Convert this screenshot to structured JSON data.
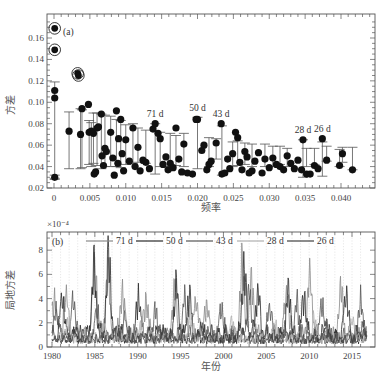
{
  "chart_data": [
    {
      "panel": "(a)",
      "type": "scatter",
      "title": "",
      "xlabel": "频率",
      "ylabel": "方差",
      "xlim": [
        0,
        0.0445
      ],
      "ylim": [
        0.02,
        0.175
      ],
      "xticks": [
        "0",
        "0.005",
        "0.010",
        "0.015",
        "0.020",
        "0.025",
        "0.030",
        "0.035",
        "0.040"
      ],
      "xtick_values": [
        0,
        0.005,
        0.01,
        0.015,
        0.02,
        0.025,
        0.03,
        0.035,
        0.04
      ],
      "yticks": [
        "0.02",
        "0.04",
        "0.06",
        "0.08",
        "0.10",
        "0.12",
        "0.14",
        "0.16"
      ],
      "ytick_values": [
        0.02,
        0.04,
        0.06,
        0.08,
        0.1,
        0.12,
        0.14,
        0.16
      ],
      "grid": false,
      "circled_points": [
        {
          "x": 0.0001,
          "y": 0.169
        },
        {
          "x": 0.0001,
          "y": 0.149
        },
        {
          "x": 0.0033,
          "y": 0.127
        },
        {
          "x": 0.0034,
          "y": 0.125
        }
      ],
      "points": [
        {
          "x": 0.0001,
          "y": 0.111,
          "err": [
            0.029,
            0.119
          ]
        },
        {
          "x": 0.0001,
          "y": 0.104
        },
        {
          "x": 0.0001,
          "y": 0.03,
          "err": [
            0.028,
            0.032
          ]
        },
        {
          "x": 0.0021,
          "y": 0.073,
          "err": [
            0.038,
            0.091
          ]
        },
        {
          "x": 0.0037,
          "y": 0.07,
          "err": [
            0.038,
            0.094
          ]
        },
        {
          "x": 0.0039,
          "y": 0.094,
          "err": [
            0.039,
            0.093
          ]
        },
        {
          "x": 0.0048,
          "y": 0.098
        },
        {
          "x": 0.0049,
          "y": 0.072,
          "err": [
            0.042,
            0.083
          ]
        },
        {
          "x": 0.0052,
          "y": 0.073,
          "err": [
            0.04,
            0.081
          ]
        },
        {
          "x": 0.0055,
          "y": 0.071,
          "err": [
            0.043,
            0.09
          ]
        },
        {
          "x": 0.0056,
          "y": 0.033
        },
        {
          "x": 0.0058,
          "y": 0.035
        },
        {
          "x": 0.006,
          "y": 0.076,
          "err": [
            0.041,
            0.09
          ]
        },
        {
          "x": 0.0062,
          "y": 0.077
        },
        {
          "x": 0.0066,
          "y": 0.089,
          "err": [
            0.038,
            0.089
          ]
        },
        {
          "x": 0.0067,
          "y": 0.05
        },
        {
          "x": 0.0069,
          "y": 0.041
        },
        {
          "x": 0.0071,
          "y": 0.057,
          "err": [
            0.04,
            0.088
          ]
        },
        {
          "x": 0.0073,
          "y": 0.054
        },
        {
          "x": 0.0079,
          "y": 0.072,
          "err": [
            0.04,
            0.087
          ]
        },
        {
          "x": 0.0082,
          "y": 0.048
        },
        {
          "x": 0.0084,
          "y": 0.032
        },
        {
          "x": 0.0087,
          "y": 0.092,
          "err": [
            0.04,
            0.084
          ]
        },
        {
          "x": 0.0089,
          "y": 0.043
        },
        {
          "x": 0.009,
          "y": 0.066
        },
        {
          "x": 0.0093,
          "y": 0.084,
          "err": [
            0.039,
            0.083
          ]
        },
        {
          "x": 0.0095,
          "y": 0.052
        },
        {
          "x": 0.0097,
          "y": 0.036
        },
        {
          "x": 0.01,
          "y": 0.065,
          "err": [
            0.042,
            0.079
          ]
        },
        {
          "x": 0.0105,
          "y": 0.045
        },
        {
          "x": 0.011,
          "y": 0.076,
          "err": [
            0.043,
            0.08
          ]
        },
        {
          "x": 0.0113,
          "y": 0.04
        },
        {
          "x": 0.0117,
          "y": 0.058,
          "err": [
            0.044,
            0.076
          ]
        },
        {
          "x": 0.012,
          "y": 0.036
        },
        {
          "x": 0.0124,
          "y": 0.046
        },
        {
          "x": 0.0128,
          "y": 0.044,
          "err": [
            0.043,
            0.074
          ]
        },
        {
          "x": 0.0133,
          "y": 0.038
        },
        {
          "x": 0.0138,
          "y": 0.075
        },
        {
          "x": 0.0141,
          "y": 0.08,
          "err": [
            0.033,
            0.08
          ]
        },
        {
          "x": 0.0145,
          "y": 0.071
        },
        {
          "x": 0.0148,
          "y": 0.066,
          "err": [
            0.04,
            0.072
          ]
        },
        {
          "x": 0.0152,
          "y": 0.042
        },
        {
          "x": 0.0156,
          "y": 0.049
        },
        {
          "x": 0.0159,
          "y": 0.037
        },
        {
          "x": 0.0162,
          "y": 0.043,
          "err": [
            0.04,
            0.071
          ]
        },
        {
          "x": 0.0166,
          "y": 0.039
        },
        {
          "x": 0.017,
          "y": 0.076,
          "err": [
            0.041,
            0.069
          ]
        },
        {
          "x": 0.0174,
          "y": 0.047
        },
        {
          "x": 0.0178,
          "y": 0.035
        },
        {
          "x": 0.0181,
          "y": 0.061,
          "err": [
            0.04,
            0.071
          ]
        },
        {
          "x": 0.0186,
          "y": 0.034
        },
        {
          "x": 0.0193,
          "y": 0.033
        },
        {
          "x": 0.0198,
          "y": 0.084
        },
        {
          "x": 0.02,
          "y": 0.084,
          "err": [
            0.038,
            0.086
          ]
        },
        {
          "x": 0.0206,
          "y": 0.055
        },
        {
          "x": 0.0209,
          "y": 0.06
        },
        {
          "x": 0.0213,
          "y": 0.037
        },
        {
          "x": 0.0216,
          "y": 0.042,
          "err": [
            0.04,
            0.067
          ]
        },
        {
          "x": 0.0219,
          "y": 0.045
        },
        {
          "x": 0.0226,
          "y": 0.062,
          "err": [
            0.047,
            0.066
          ]
        },
        {
          "x": 0.0233,
          "y": 0.08
        },
        {
          "x": 0.0234,
          "y": 0.033,
          "err": [
            0.032,
            0.078
          ]
        },
        {
          "x": 0.0238,
          "y": 0.034
        },
        {
          "x": 0.0242,
          "y": 0.047
        },
        {
          "x": 0.0245,
          "y": 0.038
        },
        {
          "x": 0.0249,
          "y": 0.052,
          "err": [
            0.04,
            0.063
          ]
        },
        {
          "x": 0.0253,
          "y": 0.072
        },
        {
          "x": 0.0256,
          "y": 0.067,
          "err": [
            0.041,
            0.064
          ]
        },
        {
          "x": 0.0259,
          "y": 0.044
        },
        {
          "x": 0.0262,
          "y": 0.037
        },
        {
          "x": 0.0266,
          "y": 0.054,
          "err": [
            0.042,
            0.062
          ]
        },
        {
          "x": 0.0269,
          "y": 0.049
        },
        {
          "x": 0.0272,
          "y": 0.034
        },
        {
          "x": 0.0276,
          "y": 0.036,
          "err": [
            0.04,
            0.061
          ]
        },
        {
          "x": 0.028,
          "y": 0.045
        },
        {
          "x": 0.0285,
          "y": 0.053
        },
        {
          "x": 0.029,
          "y": 0.034
        },
        {
          "x": 0.0294,
          "y": 0.047,
          "err": [
            0.04,
            0.061
          ]
        },
        {
          "x": 0.03,
          "y": 0.039
        },
        {
          "x": 0.0305,
          "y": 0.048,
          "err": [
            0.04,
            0.059
          ]
        },
        {
          "x": 0.031,
          "y": 0.042
        },
        {
          "x": 0.0315,
          "y": 0.04,
          "err": [
            0.042,
            0.059
          ]
        },
        {
          "x": 0.032,
          "y": 0.037
        },
        {
          "x": 0.0325,
          "y": 0.05,
          "err": [
            0.04,
            0.057
          ]
        },
        {
          "x": 0.033,
          "y": 0.043
        },
        {
          "x": 0.0335,
          "y": 0.038
        },
        {
          "x": 0.034,
          "y": 0.046
        },
        {
          "x": 0.0347,
          "y": 0.065,
          "err": [
            0.03,
            0.065
          ]
        },
        {
          "x": 0.0345,
          "y": 0.037
        },
        {
          "x": 0.0352,
          "y": 0.033,
          "err": [
            0.04,
            0.057
          ]
        },
        {
          "x": 0.0357,
          "y": 0.033
        },
        {
          "x": 0.0363,
          "y": 0.041,
          "err": [
            0.042,
            0.057
          ]
        },
        {
          "x": 0.0368,
          "y": 0.038
        },
        {
          "x": 0.0374,
          "y": 0.066,
          "err": [
            0.031,
            0.063
          ]
        },
        {
          "x": 0.038,
          "y": 0.046,
          "err": [
            0.045,
            0.059
          ]
        },
        {
          "x": 0.0398,
          "y": 0.041,
          "err": [
            0.04,
            0.056
          ]
        },
        {
          "x": 0.0402,
          "y": 0.052,
          "err": [
            0.044,
            0.058
          ]
        },
        {
          "x": 0.0416,
          "y": 0.037,
          "err": [
            0.037,
            0.058
          ]
        }
      ],
      "annotations": [
        {
          "text": "71 d",
          "x": 0.0141,
          "y": 0.083
        },
        {
          "text": "50 d",
          "x": 0.02,
          "y": 0.088
        },
        {
          "text": "43 d",
          "x": 0.0233,
          "y": 0.083
        },
        {
          "text": "28 d",
          "x": 0.0347,
          "y": 0.068
        },
        {
          "text": "26 d",
          "x": 0.0374,
          "y": 0.069
        }
      ]
    },
    {
      "panel": "(b)",
      "type": "line",
      "title": "",
      "xlabel": "年份",
      "ylabel": "局地方差",
      "y_scale_label": "×10⁻⁴",
      "xlim": [
        1979.9,
        2016.8
      ],
      "ylim": [
        0,
        9.5
      ],
      "xticks": [
        "1980",
        "1985",
        "1990",
        "1995",
        "2000",
        "2005",
        "2010",
        "2015"
      ],
      "xtick_values": [
        1980,
        1985,
        1990,
        1995,
        2000,
        2005,
        2010,
        2015
      ],
      "yticks": [
        "0",
        "2",
        "4",
        "6",
        "8"
      ],
      "ytick_values": [
        0,
        2,
        4,
        6,
        8
      ],
      "grid": "vertical dotted at each year",
      "legend": [
        "71 d",
        "50 d",
        "43 d",
        "28 d",
        "26 d"
      ],
      "legend_position": "top, inline horizontal",
      "series": [
        {
          "name": "71 d",
          "color": "#8a8a8a",
          "peaks": [
            [
              1980.3,
              4.2
            ],
            [
              1981.6,
              4.5
            ],
            [
              1985.0,
              7.4
            ],
            [
              1986.5,
              6.6
            ],
            [
              1988.2,
              5.0
            ],
            [
              1991.0,
              3.8
            ],
            [
              1994.3,
              5.3
            ],
            [
              1996.8,
              4.1
            ],
            [
              1998.0,
              3.4
            ],
            [
              2002.2,
              7.6
            ],
            [
              2003.3,
              5.8
            ],
            [
              2007.4,
              4.9
            ],
            [
              2010.1,
              6.6
            ],
            [
              2013.7,
              4.9
            ]
          ]
        },
        {
          "name": "50 d",
          "color": "#2a2a2a",
          "peaks": [
            [
              1981.2,
              4.3
            ],
            [
              1984.9,
              7.3
            ],
            [
              1986.6,
              8.9
            ],
            [
              1990.1,
              4.2
            ],
            [
              1994.5,
              5.1
            ],
            [
              1996.0,
              4.0
            ],
            [
              2002.4,
              7.2
            ],
            [
              2004.0,
              5.0
            ],
            [
              2007.6,
              4.6
            ],
            [
              2009.4,
              4.4
            ],
            [
              2014.3,
              4.6
            ]
          ]
        },
        {
          "name": "43 d",
          "color": "#555555",
          "peaks": [
            [
              1980.5,
              3.0
            ],
            [
              1982.5,
              3.8
            ],
            [
              1985.3,
              3.0
            ],
            [
              1988.5,
              2.0
            ],
            [
              1992.1,
              2.7
            ],
            [
              1995.5,
              3.9
            ],
            [
              1999.8,
              2.9
            ],
            [
              2003.0,
              4.5
            ],
            [
              2005.4,
              3.2
            ],
            [
              2008.6,
              3.5
            ],
            [
              2011.5,
              3.6
            ],
            [
              2016.0,
              3.8
            ]
          ]
        },
        {
          "name": "28 d",
          "color": "#b0b0b0",
          "peaks": [
            [
              1981.9,
              2.0
            ],
            [
              1986.0,
              1.6
            ],
            [
              1990.4,
              1.8
            ],
            [
              1996.2,
              2.2
            ],
            [
              2001.0,
              2.0
            ],
            [
              2006.0,
              1.8
            ],
            [
              2010.6,
              2.2
            ],
            [
              2015.0,
              2.4
            ]
          ]
        },
        {
          "name": "26 d",
          "color": "#404040",
          "peaks": [
            [
              1982.8,
              1.2
            ],
            [
              1987.5,
              1.3
            ],
            [
              1993.0,
              1.2
            ],
            [
              1997.4,
              1.6
            ],
            [
              2002.0,
              1.4
            ],
            [
              2007.2,
              1.3
            ],
            [
              2012.0,
              1.5
            ],
            [
              2016.3,
              1.8
            ]
          ]
        }
      ]
    }
  ],
  "panel_a": {
    "label": "(a)",
    "xlabel": "频率",
    "ylabel": "方差"
  },
  "panel_b": {
    "label": "(b)",
    "xlabel": "年份",
    "ylabel": "局地方差",
    "scale": "×10⁻⁴"
  }
}
